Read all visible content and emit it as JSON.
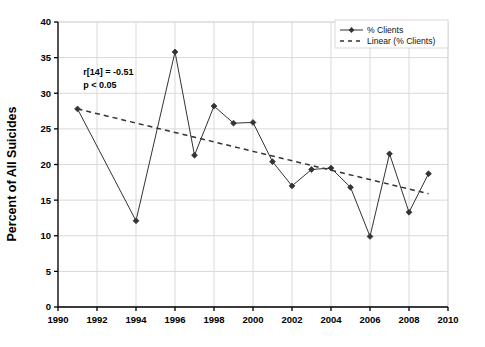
{
  "chart_data": {
    "type": "line",
    "title": "",
    "subtitle": "",
    "xlabel": "",
    "ylabel": "Percent of All Suicides",
    "xlim": [
      1990,
      2010
    ],
    "ylim": [
      0,
      40
    ],
    "ytick_step": 5,
    "xtick_step": 2,
    "grid": true,
    "legend_position": "top-right",
    "xticks": [
      "1990",
      "1992",
      "1994",
      "1996",
      "1998",
      "2000",
      "2002",
      "2004",
      "2006",
      "2008",
      "2010"
    ],
    "yticks": [
      "0",
      "5",
      "10",
      "15",
      "20",
      "25",
      "30",
      "35",
      "40"
    ],
    "x": [
      1991,
      1994,
      1996,
      1997,
      1998,
      1999,
      2000,
      2001,
      2002,
      2003,
      2004,
      2005,
      2006,
      2007,
      2008,
      2009
    ],
    "series": [
      {
        "name": "% Clients",
        "style": "solid-marker",
        "color": "#333333",
        "values": [
          27.8,
          12.1,
          35.8,
          21.3,
          28.2,
          25.8,
          25.9,
          20.4,
          17.0,
          19.3,
          19.5,
          16.8,
          9.9,
          21.5,
          13.3,
          18.7
        ]
      },
      {
        "name": "Linear (% Clients)",
        "style": "dashed",
        "color": "#333333",
        "x_endpoints": [
          1991,
          2009
        ],
        "y_endpoints": [
          27.8,
          15.9
        ]
      }
    ],
    "annotations": [
      {
        "name": "correlation",
        "text": "r[14] = -0.51",
        "x": 1991.3,
        "y": 32.6
      },
      {
        "name": "p-value",
        "text": "p < 0.05",
        "x": 1991.3,
        "y": 30.7
      }
    ]
  },
  "legend": {
    "entries": [
      {
        "label": "% Clients",
        "marker": "diamond-marker",
        "line": "solid"
      },
      {
        "label": "Linear (% Clients)",
        "marker": "none",
        "line": "dashed"
      }
    ]
  },
  "colors": {
    "axis": "#000000",
    "grid": "#d9d9d9",
    "data": "#333333",
    "legend_border": "#d9d9d9",
    "background": "#ffffff"
  }
}
